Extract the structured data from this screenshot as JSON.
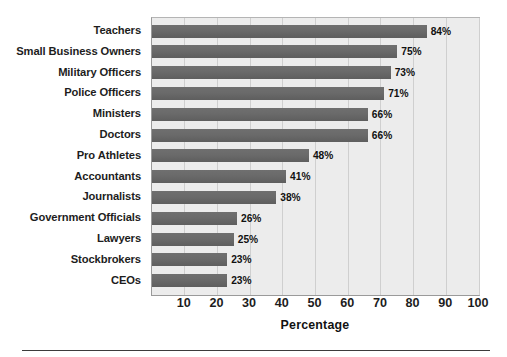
{
  "chart_data": {
    "type": "bar",
    "orientation": "horizontal",
    "title": "",
    "xlabel": "Percentage",
    "ylabel": "",
    "xlim": [
      0,
      100
    ],
    "xticks": [
      10,
      20,
      30,
      40,
      50,
      60,
      70,
      80,
      90,
      100
    ],
    "grid": true,
    "legend": false,
    "categories": [
      "Teachers",
      "Small Business Owners",
      "Military Officers",
      "Police Officers",
      "Ministers",
      "Doctors",
      "Pro Athletes",
      "Accountants",
      "Journalists",
      "Government Officials",
      "Lawyers",
      "Stockbrokers",
      "CEOs"
    ],
    "values": [
      84,
      75,
      73,
      71,
      66,
      66,
      48,
      41,
      38,
      26,
      25,
      23,
      23
    ],
    "data_labels": [
      "84%",
      "75%",
      "73%",
      "71%",
      "66%",
      "66%",
      "48%",
      "41%",
      "38%",
      "26%",
      "25%",
      "23%",
      "23%"
    ],
    "colors": {
      "bar": "#6a6a6a",
      "plot_background": "#ececec",
      "gridline": "#cfcfcf",
      "frame": "#9a9a9a",
      "text": "#1a1a1a",
      "page_background": "#ffffff",
      "rule": "#3c3c3c"
    }
  }
}
